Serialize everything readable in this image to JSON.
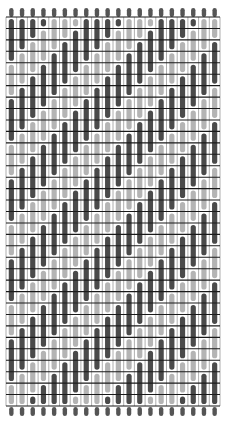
{
  "diagram": {
    "type": "weave-draft",
    "columns": 20,
    "rows": 34,
    "dark_run_rows": 4,
    "light_run_rows": 3,
    "step_per_column": 1,
    "colors": {
      "background": "#ffffff",
      "dark_bar": "#4a4a4a",
      "light_bar": "#b4b4b4",
      "grid_line": "#1a1a1a",
      "thin_line": "#9a9a9a",
      "end_dot": "#555555"
    }
  }
}
